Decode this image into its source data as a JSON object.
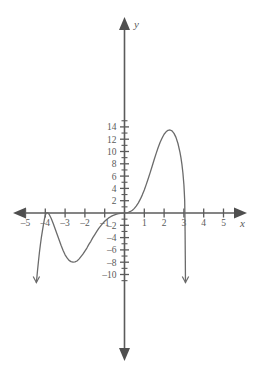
{
  "chart_data": {
    "type": "line",
    "title": "",
    "xlabel": "x",
    "ylabel": "y",
    "xlim": [
      -5.6,
      5.8
    ],
    "ylim": [
      -11.5,
      15.2
    ],
    "grid": false,
    "legend": null,
    "x_ticks": [
      -5,
      -4,
      -3,
      -2,
      -1,
      1,
      2,
      3,
      4,
      5
    ],
    "x_tick_labels": [
      "-5",
      "-4",
      "-3",
      "-2",
      "-1",
      "1",
      "2",
      "3",
      "4",
      "5"
    ],
    "y_ticks": [
      -10,
      -8,
      -6,
      -4,
      -2,
      2,
      4,
      6,
      8,
      10,
      12,
      14
    ],
    "y_tick_labels": [
      "-10",
      "-8",
      "-6",
      "-4",
      "-2",
      "2",
      "4",
      "6",
      "8",
      "10",
      "12",
      "14"
    ],
    "y_minor_tick_step": 1,
    "x_minor_tick_step": 1,
    "axis_arrows": [
      "left",
      "right",
      "up",
      "down"
    ],
    "series": [
      {
        "name": "polynomial",
        "description": "quintic polynomial with double roots at x=-4 and x=0 and a simple root at x=3, negative leading coefficient",
        "points": [
          [
            -4.45,
            -11.3
          ],
          [
            -4.4,
            -9.6
          ],
          [
            -4.35,
            -8.0
          ],
          [
            -4.3,
            -6.5
          ],
          [
            -4.25,
            -5.2
          ],
          [
            -4.2,
            -4.0
          ],
          [
            -4.15,
            -3.0
          ],
          [
            -4.1,
            -2.0
          ],
          [
            -4.05,
            -1.1
          ],
          [
            -4.0,
            -0.35
          ],
          [
            -3.95,
            0.02
          ],
          [
            -3.9,
            0.05
          ],
          [
            -3.85,
            0.0
          ],
          [
            -3.8,
            -0.25
          ],
          [
            -3.7,
            -0.9
          ],
          [
            -3.6,
            -1.7
          ],
          [
            -3.5,
            -2.6
          ],
          [
            -3.4,
            -3.5
          ],
          [
            -3.3,
            -4.4
          ],
          [
            -3.2,
            -5.3
          ],
          [
            -3.1,
            -6.1
          ],
          [
            -3.0,
            -6.8
          ],
          [
            -2.9,
            -7.3
          ],
          [
            -2.8,
            -7.7
          ],
          [
            -2.7,
            -7.9
          ],
          [
            -2.6,
            -8.0
          ],
          [
            -2.5,
            -7.95
          ],
          [
            -2.4,
            -7.8
          ],
          [
            -2.3,
            -7.5
          ],
          [
            -2.2,
            -7.1
          ],
          [
            -2.1,
            -6.7
          ],
          [
            -2.0,
            -6.2
          ],
          [
            -1.9,
            -5.7
          ],
          [
            -1.8,
            -5.1
          ],
          [
            -1.7,
            -4.6
          ],
          [
            -1.6,
            -4.0
          ],
          [
            -1.5,
            -3.5
          ],
          [
            -1.4,
            -3.0
          ],
          [
            -1.3,
            -2.5
          ],
          [
            -1.2,
            -2.1
          ],
          [
            -1.1,
            -1.7
          ],
          [
            -1.0,
            -1.35
          ],
          [
            -0.9,
            -1.05
          ],
          [
            -0.8,
            -0.8
          ],
          [
            -0.7,
            -0.6
          ],
          [
            -0.6,
            -0.42
          ],
          [
            -0.5,
            -0.3
          ],
          [
            -0.4,
            -0.19
          ],
          [
            -0.3,
            -0.11
          ],
          [
            -0.2,
            -0.05
          ],
          [
            -0.1,
            -0.02
          ],
          [
            0.0,
            0.0
          ],
          [
            0.1,
            0.02
          ],
          [
            0.2,
            0.1
          ],
          [
            0.3,
            0.25
          ],
          [
            0.4,
            0.45
          ],
          [
            0.5,
            0.75
          ],
          [
            0.6,
            1.15
          ],
          [
            0.7,
            1.65
          ],
          [
            0.8,
            2.25
          ],
          [
            0.9,
            2.95
          ],
          [
            1.0,
            3.75
          ],
          [
            1.1,
            4.65
          ],
          [
            1.2,
            5.6
          ],
          [
            1.3,
            6.6
          ],
          [
            1.4,
            7.65
          ],
          [
            1.5,
            8.7
          ],
          [
            1.6,
            9.7
          ],
          [
            1.7,
            10.65
          ],
          [
            1.8,
            11.5
          ],
          [
            1.9,
            12.2
          ],
          [
            2.0,
            12.8
          ],
          [
            2.1,
            13.2
          ],
          [
            2.2,
            13.45
          ],
          [
            2.3,
            13.5
          ],
          [
            2.4,
            13.35
          ],
          [
            2.5,
            12.95
          ],
          [
            2.6,
            12.3
          ],
          [
            2.7,
            11.3
          ],
          [
            2.8,
            9.9
          ],
          [
            2.85,
            9.0
          ],
          [
            2.9,
            7.9
          ],
          [
            2.95,
            6.5
          ],
          [
            3.0,
            4.6
          ],
          [
            3.02,
            3.4
          ],
          [
            3.04,
            2.0
          ],
          [
            3.05,
            0.0
          ],
          [
            3.06,
            -3.0
          ],
          [
            3.07,
            -7.0
          ],
          [
            3.08,
            -11.3
          ]
        ],
        "features": {
          "x_intercepts": [
            -4,
            0,
            3
          ],
          "local_max": [
            [
              -4,
              0
            ],
            [
              2.3,
              13.5
            ]
          ],
          "local_min": [
            [
              -2.6,
              -8.0
            ]
          ],
          "end_behavior_left": "falls to -infinity",
          "end_behavior_right": "falls to -infinity"
        }
      }
    ]
  },
  "labels": {
    "x_axis": "x",
    "y_axis": "y"
  },
  "colors": {
    "axis": "#5b5b5b",
    "curve": "#6b6b6b",
    "text": "#5a5a5a",
    "background": "#ffffff"
  }
}
